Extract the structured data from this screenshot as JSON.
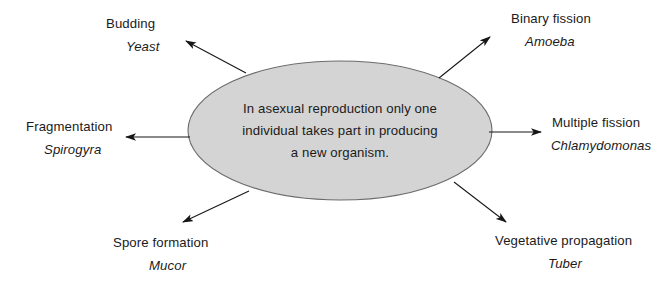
{
  "diagram": {
    "type": "spider-radial",
    "center": {
      "shape": "ellipse",
      "fill_color": "#d4d4d4",
      "stroke_color": "#6b6b6b",
      "lines": [
        "In asexual reproduction only one",
        "individual takes part in producing",
        "a new organism."
      ]
    },
    "nodes": [
      {
        "id": "budding",
        "title": "Budding",
        "example": "Yeast",
        "direction": "top-left",
        "arrow": {
          "from_x": 246,
          "from_y": 73,
          "to_x": 186,
          "to_y": 41
        }
      },
      {
        "id": "binary-fission",
        "title": "Binary fission",
        "example": "Amoeba",
        "direction": "top-right",
        "arrow": {
          "from_x": 439,
          "from_y": 78,
          "to_x": 490,
          "to_y": 37
        }
      },
      {
        "id": "fragmentation",
        "title": "Fragmentation",
        "example": "Spirogyra",
        "direction": "left",
        "arrow": {
          "from_x": 190,
          "from_y": 137,
          "to_x": 126,
          "to_y": 137
        }
      },
      {
        "id": "multiple-fission",
        "title": "Multiple fission",
        "example": "Chlamydomonas",
        "direction": "right",
        "arrow": {
          "from_x": 489,
          "from_y": 132,
          "to_x": 541,
          "to_y": 132
        }
      },
      {
        "id": "spore-formation",
        "title": "Spore formation",
        "example": "Mucor",
        "direction": "bottom-left",
        "arrow": {
          "from_x": 249,
          "from_y": 191,
          "to_x": 183,
          "to_y": 222
        }
      },
      {
        "id": "vegetative-propagation",
        "title": "Vegetative propagation",
        "example": "Tuber",
        "direction": "bottom-right",
        "arrow": {
          "from_x": 454,
          "from_y": 182,
          "to_x": 506,
          "to_y": 222
        }
      }
    ]
  }
}
